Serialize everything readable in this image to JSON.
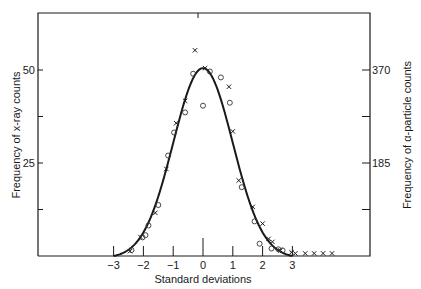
{
  "chart_data": {
    "type": "scatter",
    "title": "",
    "xlabel": "Standard deviations",
    "ylabel_left": "Frequency of x-ray counts",
    "ylabel_right": "Frequency of α-particle counts",
    "x_ticks": [
      -3,
      -2,
      -1,
      0,
      1,
      2,
      3
    ],
    "x_tick_labels": [
      "−3",
      "−2",
      "−1",
      "0",
      "1",
      "2",
      "3"
    ],
    "y_left_ticks": [
      0,
      12.5,
      25,
      37.5,
      50
    ],
    "y_left_tick_labels": [
      "",
      "",
      "25",
      "",
      "50"
    ],
    "y_right_ticks": [
      0,
      92.5,
      185,
      277.5,
      370
    ],
    "y_right_tick_labels": [
      "",
      "",
      "185",
      "",
      "370"
    ],
    "xlim": [
      -6.0,
      5.6
    ],
    "ylim_left": [
      0,
      65
    ],
    "ylim_right": [
      0,
      481
    ],
    "grid": false,
    "legend": null,
    "series": [
      {
        "name": "Normal curve",
        "style": "line",
        "mean": 0,
        "sd": 1,
        "peak": 50.5,
        "x_range": [
          -3,
          3
        ]
      },
      {
        "name": "x-ray counts",
        "marker": "x",
        "points": [
          [
            -0.27,
            55.3
          ],
          [
            0.07,
            50.5
          ],
          [
            0.87,
            45.5
          ],
          [
            -0.6,
            41.7
          ],
          [
            -0.9,
            35.7
          ],
          [
            -1.23,
            23.4
          ],
          [
            1.0,
            33.5
          ],
          [
            1.2,
            20.3
          ],
          [
            1.67,
            13.2
          ],
          [
            -1.6,
            11.6
          ],
          [
            2.0,
            8.7
          ],
          [
            2.2,
            4.6
          ],
          [
            -2.1,
            5.1
          ],
          [
            2.33,
            3.8
          ],
          [
            2.6,
            1.5
          ],
          [
            -2.45,
            1.3
          ],
          [
            2.97,
            1.0
          ],
          [
            3.1,
            0.7
          ],
          [
            3.43,
            0.7
          ],
          [
            3.73,
            0.7
          ],
          [
            4.03,
            0.7
          ],
          [
            4.33,
            0.7
          ]
        ]
      },
      {
        "name": "α-particle counts",
        "marker": "o",
        "points": [
          [
            -0.33,
            49.0
          ],
          [
            0.23,
            49.6
          ],
          [
            0.6,
            48.0
          ],
          [
            0.9,
            41.2
          ],
          [
            0.0,
            40.4
          ],
          [
            -0.6,
            38.6
          ],
          [
            -0.97,
            33.2
          ],
          [
            -1.17,
            27.0
          ],
          [
            -1.5,
            13.7
          ],
          [
            -1.83,
            8.2
          ],
          [
            -1.93,
            5.6
          ],
          [
            -2.03,
            5.0
          ],
          [
            -2.4,
            1.6
          ],
          [
            1.3,
            18.5
          ],
          [
            1.73,
            9.3
          ],
          [
            1.9,
            3.3
          ],
          [
            2.3,
            2.0
          ],
          [
            2.53,
            1.8
          ],
          [
            2.67,
            1.5
          ]
        ]
      }
    ]
  }
}
